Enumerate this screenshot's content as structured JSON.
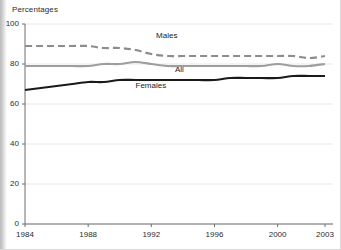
{
  "chart_data": {
    "type": "line",
    "title": "Percentages",
    "xlabel": "",
    "ylabel": "",
    "xlim": [
      1984,
      2003
    ],
    "ylim": [
      0,
      100
    ],
    "grid": true,
    "legend_position": "inline-annotations",
    "x": [
      1984,
      1985,
      1986,
      1987,
      1988,
      1989,
      1990,
      1991,
      1992,
      1993,
      1994,
      1995,
      1996,
      1997,
      1998,
      1999,
      2000,
      2001,
      2002,
      2003
    ],
    "series": [
      {
        "name": "Males",
        "style": "dashed",
        "color": "#8c8c8c",
        "values": [
          89,
          89,
          89,
          89,
          89,
          88,
          88,
          87,
          85,
          84,
          84,
          84,
          84,
          84,
          84,
          84,
          84,
          84,
          83,
          84
        ]
      },
      {
        "name": "All",
        "style": "solid",
        "color": "#9e9e9e",
        "values": [
          79,
          79,
          79,
          79,
          79,
          80,
          80,
          81,
          80,
          79,
          79,
          79,
          79,
          79,
          79,
          79,
          80,
          79,
          79,
          80
        ]
      },
      {
        "name": "Females",
        "style": "solid",
        "color": "#1a1a1a",
        "values": [
          67,
          68,
          69,
          70,
          71,
          71,
          72,
          72,
          72,
          72,
          72,
          72,
          72,
          73,
          73,
          73,
          73,
          74,
          74,
          74
        ]
      }
    ],
    "yticks": [
      {
        "value": 0,
        "label": "0"
      },
      {
        "value": 20,
        "label": "20"
      },
      {
        "value": 40,
        "label": "40"
      },
      {
        "value": 60,
        "label": "60"
      },
      {
        "value": 80,
        "label": "80"
      },
      {
        "value": 100,
        "label": "100"
      }
    ],
    "xticks": [
      {
        "value": 1984,
        "label": "1984"
      },
      {
        "value": 1988,
        "label": "1988"
      },
      {
        "value": 1992,
        "label": "1992"
      },
      {
        "value": 1996,
        "label": "1996"
      },
      {
        "value": 2000,
        "label": "2000"
      },
      {
        "value": 2003,
        "label": "2003"
      }
    ],
    "annotations": [
      {
        "text": "Males",
        "x": 1992.3,
        "y": 94
      },
      {
        "text": "All",
        "x": 1993.5,
        "y": 77
      },
      {
        "text": "Females",
        "x": 1991.0,
        "y": 69
      }
    ],
    "colors": {
      "axis": "#6e6e6e",
      "grid": "#e8e8e8",
      "text": "#2b2b2b",
      "males": "#8c8c8c",
      "all": "#9e9e9e",
      "females": "#1a1a1a"
    }
  }
}
